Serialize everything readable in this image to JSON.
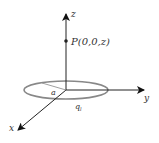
{
  "diagram": {
    "axes": {
      "x": "x",
      "y": "y",
      "z": "z"
    },
    "point_label": "P(0,0,z)",
    "radius_label": "a",
    "charge_label": "q",
    "charge_subscript": "l",
    "colors": {
      "axis": "#222222",
      "ring": "#888888",
      "radius": "#888888"
    }
  }
}
